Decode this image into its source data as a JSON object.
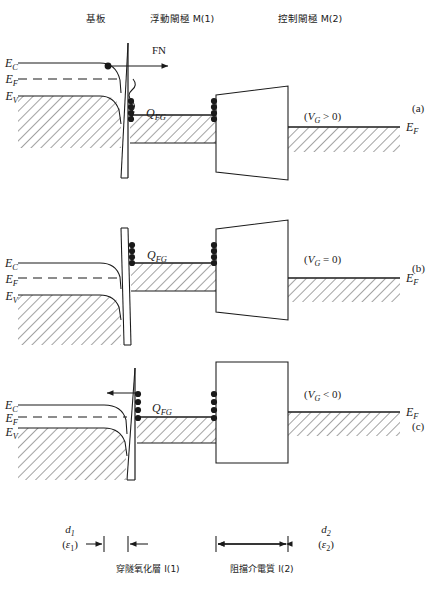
{
  "figure": {
    "type": "band-diagram",
    "title_labels": {
      "substrate": "基板",
      "floating_gate": "浮動閘極 M(1)",
      "control_gate": "控制閘極 M(2)"
    },
    "panels": [
      {
        "id": "a",
        "tag": "(a)",
        "bias_label": "(V_G > 0)",
        "bias_parts": {
          "open": "(",
          "v": "V",
          "sub": "G",
          "rel": "> 0",
          "close": ")"
        },
        "charge_label": "Q_FG",
        "charge_parts": {
          "q": "Q",
          "sub": "FG"
        },
        "tunnel_label": "FN",
        "left_levels": [
          {
            "name": "E_C",
            "sym": "E",
            "sub": "C"
          },
          {
            "name": "E_F",
            "sym": "E",
            "sub": "F"
          },
          {
            "name": "E_V",
            "sym": "E",
            "sub": "V"
          }
        ],
        "right_level": {
          "name": "E_F",
          "sym": "E",
          "sub": "F"
        },
        "electron_dots_left": 4,
        "electron_dots_right": 4,
        "arrow_direction": "right"
      },
      {
        "id": "b",
        "tag": "(b)",
        "bias_label": "(V_G = 0)",
        "bias_parts": {
          "open": "(",
          "v": "V",
          "sub": "G",
          "rel": "= 0",
          "close": ")"
        },
        "charge_label": "Q_FG",
        "charge_parts": {
          "q": "Q",
          "sub": "FG"
        },
        "tunnel_label": "",
        "left_levels": [
          {
            "name": "E_C",
            "sym": "E",
            "sub": "C"
          },
          {
            "name": "E_F",
            "sym": "E",
            "sub": "F"
          },
          {
            "name": "E_V",
            "sym": "E",
            "sub": "V"
          }
        ],
        "right_level": {
          "name": "E_F",
          "sym": "E",
          "sub": "F"
        },
        "electron_dots_left": 4,
        "electron_dots_right": 4,
        "arrow_direction": "none"
      },
      {
        "id": "c",
        "tag": "(c)",
        "bias_label": "(V_G < 0)",
        "bias_parts": {
          "open": "(",
          "v": "V",
          "sub": "G",
          "rel": "< 0",
          "close": ")"
        },
        "charge_label": "Q_FG",
        "charge_parts": {
          "q": "Q",
          "sub": "FG"
        },
        "tunnel_label": "",
        "left_levels": [
          {
            "name": "E_C",
            "sym": "E",
            "sub": "C"
          },
          {
            "name": "E_F",
            "sym": "E",
            "sub": "F"
          },
          {
            "name": "E_V",
            "sym": "E",
            "sub": "V"
          }
        ],
        "right_level": {
          "name": "E_F",
          "sym": "E",
          "sub": "F"
        },
        "electron_dots_left": 4,
        "electron_dots_right": 4,
        "arrow_direction": "left"
      }
    ],
    "dimensions": {
      "left": {
        "d": "d",
        "dsub": "1",
        "eps_open": "(",
        "eps": "ε",
        "eps_sub": "1",
        "eps_close": ")"
      },
      "right": {
        "d": "d",
        "dsub": "2",
        "eps_open": "(",
        "eps": "ε",
        "eps_sub": "2",
        "eps_close": ")"
      }
    },
    "bottom_labels": {
      "tunnel_oxide": "穿隧氧化層 I(1)",
      "blocking_dielectric": "阻擋介電質 I(2)"
    },
    "colors": {
      "line": "#1a1a1a",
      "hatch": "#333333",
      "background": "#ffffff"
    }
  }
}
